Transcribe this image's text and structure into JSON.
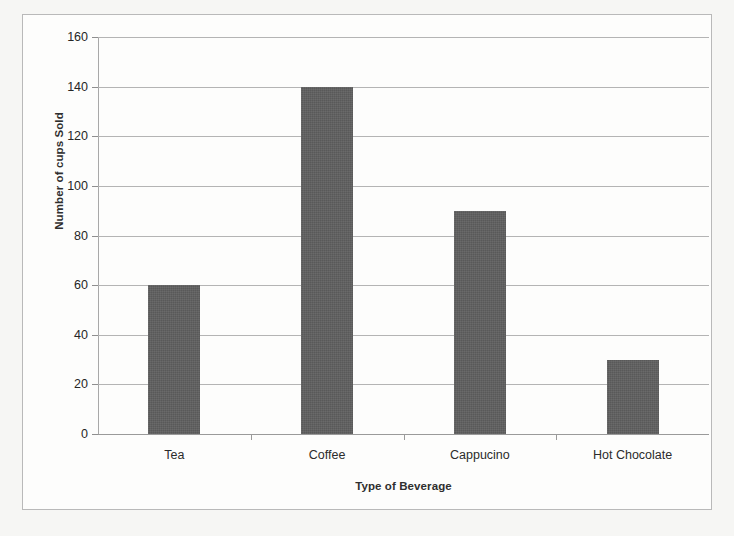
{
  "chart_data": {
    "type": "bar",
    "title": "",
    "categories": [
      "Tea",
      "Coffee",
      "Cappucino",
      "Hot Chocolate"
    ],
    "values": [
      60,
      140,
      90,
      30
    ],
    "xlabel": "Type of Beverage",
    "ylabel": "Number of cups Sold",
    "ylim": [
      0,
      160
    ],
    "ytick_step": 20,
    "yticks": [
      160,
      140,
      120,
      100,
      80,
      60,
      40,
      20,
      0
    ],
    "ytick_labels": [
      "160",
      "140",
      "120",
      "100",
      "80",
      "60",
      "40",
      "20",
      "0"
    ],
    "grid": true,
    "legend": false,
    "legend_position": "none",
    "bar_color": "#595959",
    "gridline_color": "#b4b4b4",
    "axis_color": "#9a9a9a",
    "plot_background": "#fdfdfc",
    "page_background": "#f6f6f4"
  }
}
